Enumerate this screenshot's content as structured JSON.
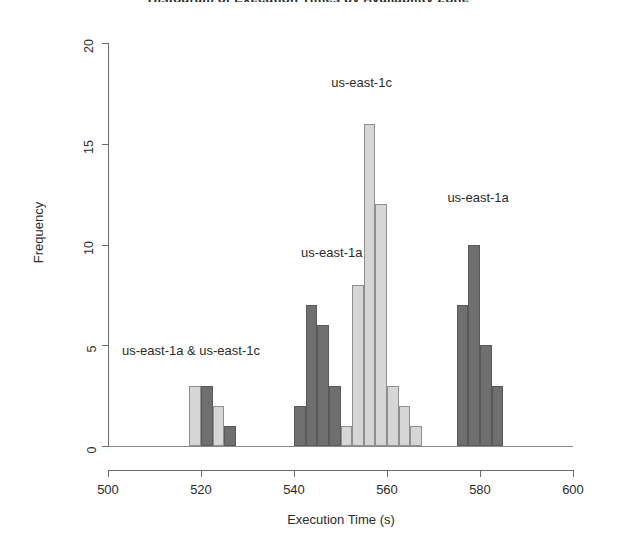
{
  "chart_data": {
    "type": "bar",
    "title": "Histogram of Execution Times by Availability Zone",
    "xlabel": "Execution Time (s)",
    "ylabel": "Frequency",
    "xlim": [
      500,
      600
    ],
    "ylim": [
      0,
      20
    ],
    "x_ticks": [
      500,
      520,
      540,
      560,
      580,
      600
    ],
    "y_ticks": [
      0,
      5,
      10,
      15,
      20
    ],
    "grid": false,
    "legend_position": "in-plot annotations",
    "bin_width": 2.5,
    "colors": {
      "us-east-1a": "#6f6f6f",
      "us-east-1c": "#d6d6d6",
      "axis": "#6a6a6a",
      "text": "#2b2b2b"
    },
    "series": [
      {
        "name": "us-east-1a",
        "color": "#6f6f6f",
        "bins": [
          {
            "x0": 520.0,
            "x1": 522.5,
            "count": 3
          },
          {
            "x0": 525.0,
            "x1": 527.5,
            "count": 1
          },
          {
            "x0": 540.0,
            "x1": 542.5,
            "count": 2
          },
          {
            "x0": 542.5,
            "x1": 545.0,
            "count": 7
          },
          {
            "x0": 545.0,
            "x1": 547.5,
            "count": 6
          },
          {
            "x0": 547.5,
            "x1": 550.0,
            "count": 3
          },
          {
            "x0": 575.0,
            "x1": 577.5,
            "count": 7
          },
          {
            "x0": 577.5,
            "x1": 580.0,
            "count": 10
          },
          {
            "x0": 580.0,
            "x1": 582.5,
            "count": 5
          },
          {
            "x0": 582.5,
            "x1": 585.0,
            "count": 3
          }
        ]
      },
      {
        "name": "us-east-1c",
        "color": "#d6d6d6",
        "bins": [
          {
            "x0": 517.5,
            "x1": 520.0,
            "count": 3
          },
          {
            "x0": 522.5,
            "x1": 525.0,
            "count": 2
          },
          {
            "x0": 550.0,
            "x1": 552.5,
            "count": 1
          },
          {
            "x0": 552.5,
            "x1": 555.0,
            "count": 8
          },
          {
            "x0": 555.0,
            "x1": 557.5,
            "count": 16
          },
          {
            "x0": 557.5,
            "x1": 560.0,
            "count": 12
          },
          {
            "x0": 560.0,
            "x1": 562.5,
            "count": 3
          },
          {
            "x0": 562.5,
            "x1": 565.0,
            "count": 2
          },
          {
            "x0": 565.0,
            "x1": 567.5,
            "count": 1
          }
        ]
      }
    ],
    "annotations": [
      {
        "text": "us-east-1a & us-east-1c",
        "x": 503.0,
        "y": 4.7,
        "align": "left"
      },
      {
        "text": "us-east-1a",
        "x": 541.5,
        "y": 9.6,
        "align": "left"
      },
      {
        "text": "us-east-1c",
        "x": 548.0,
        "y": 18.0,
        "align": "left"
      },
      {
        "text": "us-east-1a",
        "x": 573.0,
        "y": 12.3,
        "align": "left"
      }
    ]
  },
  "axes": {
    "y_title": "Frequency",
    "x_title": "Execution Time (s)",
    "y_tick_labels": [
      "0",
      "5",
      "10",
      "15",
      "20"
    ],
    "x_tick_labels": [
      "500",
      "520",
      "540",
      "560",
      "580",
      "600"
    ]
  },
  "labels": {
    "ann0": "us-east-1a & us-east-1c",
    "ann1": "us-east-1a",
    "ann2": "us-east-1c",
    "ann3": "us-east-1a"
  },
  "title": {
    "text": "Histogram of Execution Times by Availability Zone"
  }
}
